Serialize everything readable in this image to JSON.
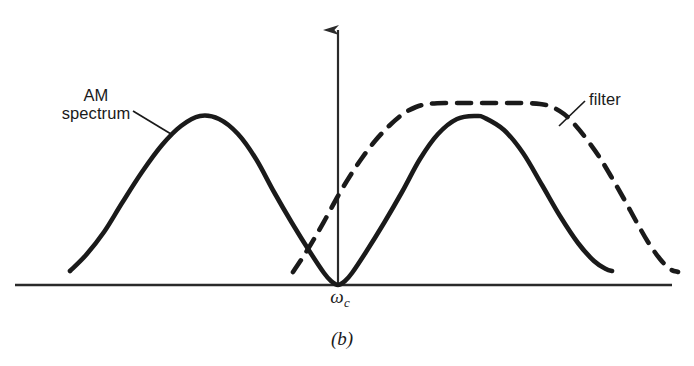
{
  "figure": {
    "caption": "(b)",
    "axis_label": "ω",
    "axis_label_subscript": "c",
    "annotations": {
      "am_spectrum_line1": "AM",
      "am_spectrum_line2": "spectrum",
      "filter": "filter"
    },
    "colors": {
      "ink": "#1a1a1a",
      "background": "#ffffff",
      "axis": "#2a2a2a"
    }
  },
  "chart_data": {
    "type": "line",
    "title": "",
    "subtitle": "",
    "xlabel": "ω",
    "ylabel": "",
    "grid": false,
    "legend": "annotations",
    "axis": {
      "baseline_y": 285,
      "baseline_x_start": 15,
      "baseline_x_end": 672,
      "vertical_axis_x": 338,
      "vertical_axis_top_y": 22,
      "vertical_axis_has_arrowhead": true,
      "origin_tick_label": "ωc"
    },
    "annotations": [
      {
        "text": "AM spectrum",
        "label_x": 96,
        "label_y": 104,
        "leader_from": [
          133,
          111
        ],
        "leader_to": [
          171,
          134
        ]
      },
      {
        "text": "filter",
        "label_x": 614,
        "label_y": 101,
        "leader_from": [
          585,
          101
        ],
        "leader_to": [
          559,
          126
        ]
      }
    ],
    "series": [
      {
        "name": "AM spectrum",
        "style": "solid",
        "linewidth": 4.6,
        "color": "#1a1a1a",
        "description": "Double-lobed AM spectrum; two rounded lobes of equal height meeting at a tangent zero on the baseline at the carrier frequency.",
        "points": [
          [
            70,
            271
          ],
          [
            86,
            255
          ],
          [
            104,
            232
          ],
          [
            122,
            203
          ],
          [
            142,
            172
          ],
          [
            162,
            145
          ],
          [
            181,
            126
          ],
          [
            200,
            116
          ],
          [
            219,
            119
          ],
          [
            238,
            134
          ],
          [
            256,
            159
          ],
          [
            274,
            192
          ],
          [
            292,
            223
          ],
          [
            310,
            252
          ],
          [
            324,
            273
          ],
          [
            331,
            281
          ],
          [
            338,
            285
          ],
          [
            345,
            281
          ],
          [
            352,
            273
          ],
          [
            366,
            252
          ],
          [
            384,
            223
          ],
          [
            402,
            192
          ],
          [
            420,
            159
          ],
          [
            438,
            134
          ],
          [
            457,
            119
          ],
          [
            476,
            116
          ],
          [
            485,
            118
          ],
          [
            504,
            130
          ],
          [
            523,
            153
          ],
          [
            542,
            185
          ],
          [
            560,
            216
          ],
          [
            578,
            243
          ],
          [
            594,
            261
          ],
          [
            606,
            269
          ],
          [
            612,
            271
          ]
        ]
      },
      {
        "name": "filter",
        "style": "dashed",
        "linewidth": 4.6,
        "dash_pattern": [
          14,
          11
        ],
        "color": "#1a1a1a",
        "description": "Bandpass filter response: flat-topped passband centred above the upper AM lobe, with rolled-off skirts; left skirt crosses the AM spectrum just left of the carrier.",
        "points": [
          [
            293,
            272
          ],
          [
            303,
            257
          ],
          [
            314,
            239
          ],
          [
            326,
            218
          ],
          [
            338,
            196
          ],
          [
            350,
            176
          ],
          [
            362,
            158
          ],
          [
            375,
            141
          ],
          [
            389,
            126
          ],
          [
            403,
            114
          ],
          [
            416,
            107
          ],
          [
            428,
            104
          ],
          [
            445,
            103
          ],
          [
            470,
            103
          ],
          [
            495,
            103
          ],
          [
            520,
            103
          ],
          [
            540,
            104
          ],
          [
            552,
            107
          ],
          [
            564,
            114
          ],
          [
            576,
            126
          ],
          [
            588,
            141
          ],
          [
            600,
            158
          ],
          [
            612,
            178
          ],
          [
            624,
            199
          ],
          [
            636,
            221
          ],
          [
            648,
            242
          ],
          [
            660,
            259
          ],
          [
            670,
            269
          ],
          [
            678,
            272
          ]
        ]
      }
    ]
  }
}
